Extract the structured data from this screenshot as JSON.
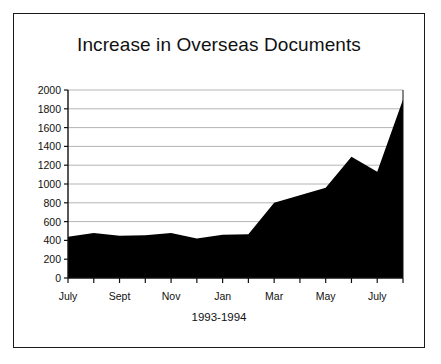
{
  "figure": {
    "title": "Increase in Overseas Documents",
    "border_color": "#1a1a1a",
    "background": "#ffffff"
  },
  "chart_data": {
    "type": "area",
    "title": "Increase in Overseas Documents",
    "xlabel": "1993-1994",
    "ylabel": "",
    "fill_color": "#000000",
    "grid": true,
    "grid_color": "#b5b5b5",
    "legend": "none",
    "ylim": [
      0,
      2000
    ],
    "ytick_labels": [
      "0",
      "200",
      "400",
      "600",
      "800",
      "1000",
      "1200",
      "1400",
      "1600",
      "1800",
      "2000"
    ],
    "ytick_values": [
      0,
      200,
      400,
      600,
      800,
      1000,
      1200,
      1400,
      1600,
      1800,
      2000
    ],
    "xtick_labels": [
      "July",
      "Sept",
      "Nov",
      "Jan",
      "Mar",
      "May",
      "July"
    ],
    "xtick_label_indices": [
      0,
      2,
      4,
      6,
      8,
      10,
      12
    ],
    "categories": [
      "July",
      "Aug",
      "Sept",
      "Oct",
      "Nov",
      "Dec",
      "Jan",
      "Feb",
      "Mar",
      "Apr",
      "May",
      "June",
      "July",
      "Aug"
    ],
    "values": [
      440,
      480,
      450,
      455,
      480,
      420,
      460,
      465,
      800,
      880,
      960,
      1290,
      1130,
      1900
    ]
  }
}
